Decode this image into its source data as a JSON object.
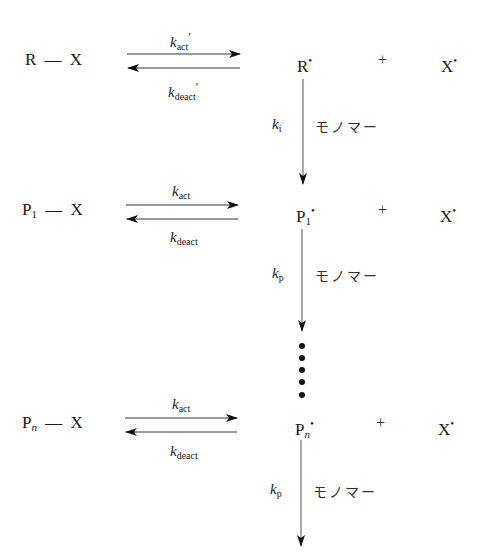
{
  "diagram": {
    "rows": [
      {
        "dormant": {
          "base": "R",
          "sub": "",
          "sub_italic": false,
          "bond": "—",
          "cap": "X"
        },
        "forward_rate": {
          "k": "k",
          "sub": "act",
          "prime": "′"
        },
        "reverse_rate": {
          "k": "k",
          "sub": "deact",
          "prime": "′"
        },
        "radical": {
          "base": "R",
          "sub": "",
          "sub_italic": false,
          "dot": "•"
        },
        "plus": "+",
        "cap_radical": {
          "base": "X",
          "dot": "•"
        },
        "down_step": {
          "k": "k",
          "sub": "i",
          "reagent": "モノマー"
        }
      },
      {
        "dormant": {
          "base": "P",
          "sub": "1",
          "sub_italic": false,
          "bond": "—",
          "cap": "X"
        },
        "forward_rate": {
          "k": "k",
          "sub": "act",
          "prime": ""
        },
        "reverse_rate": {
          "k": "k",
          "sub": "deact",
          "prime": ""
        },
        "radical": {
          "base": "P",
          "sub": "1",
          "sub_italic": false,
          "dot": "•"
        },
        "plus": "+",
        "cap_radical": {
          "base": "X",
          "dot": "•"
        },
        "down_step": {
          "k": "k",
          "sub": "p",
          "reagent": "モノマー"
        }
      },
      {
        "dormant": {
          "base": "P",
          "sub": "n",
          "sub_italic": true,
          "bond": "—",
          "cap": "X"
        },
        "forward_rate": {
          "k": "k",
          "sub": "act",
          "prime": ""
        },
        "reverse_rate": {
          "k": "k",
          "sub": "deact",
          "prime": ""
        },
        "radical": {
          "base": "P",
          "sub": "n",
          "sub_italic": true,
          "dot": "•"
        },
        "plus": "+",
        "cap_radical": {
          "base": "X",
          "dot": "•"
        },
        "down_step": {
          "k": "k",
          "sub": "p",
          "reagent": "モノマー"
        }
      }
    ],
    "ellipsis_dots": 5,
    "colors": {
      "ink": "#1a1a1a",
      "arrow": "#222222",
      "line": "#555555"
    }
  }
}
